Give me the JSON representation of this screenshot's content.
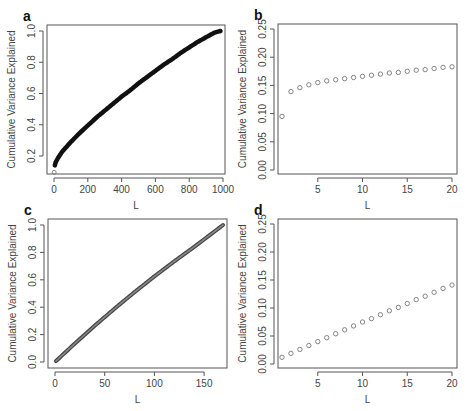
{
  "figure": {
    "panels": [
      "a",
      "b",
      "c",
      "d"
    ]
  },
  "chart_data": [
    {
      "panel": "a",
      "type": "scatter",
      "title": "",
      "xlabel": "L",
      "ylabel": "Cumulative Variance Explained",
      "xlim": [
        0,
        1000
      ],
      "ylim": [
        0.08,
        1.02
      ],
      "xticks": [
        0,
        200,
        400,
        600,
        800,
        1000
      ],
      "xtick_labels": [
        "0",
        "200",
        "400",
        "600",
        "800",
        "1000"
      ],
      "yticks": [
        0.2,
        0.4,
        0.6,
        0.8,
        1.0
      ],
      "ytick_labels": [
        "0.2",
        "0.4",
        "0.6",
        "0.8",
        "1.0"
      ],
      "grid": false,
      "legend": null,
      "description": "Dense points forming a thick concave curve from about 0.095 at L=1 to 1.0 at L≈985",
      "x": [
        1,
        5,
        10,
        25,
        50,
        100,
        150,
        200,
        250,
        300,
        350,
        400,
        450,
        500,
        550,
        600,
        650,
        700,
        750,
        800,
        850,
        900,
        950,
        985
      ],
      "y": [
        0.095,
        0.14,
        0.16,
        0.19,
        0.23,
        0.29,
        0.345,
        0.395,
        0.445,
        0.49,
        0.535,
        0.58,
        0.62,
        0.665,
        0.705,
        0.745,
        0.785,
        0.82,
        0.86,
        0.895,
        0.93,
        0.96,
        0.99,
        1.0
      ]
    },
    {
      "panel": "b",
      "type": "scatter",
      "title": "",
      "xlabel": "L",
      "ylabel": "Cumulative Variance Explained",
      "xlim": [
        0.5,
        20.5
      ],
      "ylim": [
        0.0,
        0.25
      ],
      "xticks": [
        5,
        10,
        15,
        20
      ],
      "xtick_labels": [
        "5",
        "10",
        "15",
        "20"
      ],
      "yticks": [
        0.0,
        0.05,
        0.1,
        0.15,
        0.2,
        0.25
      ],
      "ytick_labels": [
        "0.00",
        "0.05",
        "0.10",
        "0.15",
        "0.20",
        "0.25"
      ],
      "grid": false,
      "legend": null,
      "x": [
        1,
        2,
        3,
        4,
        5,
        6,
        7,
        8,
        9,
        10,
        11,
        12,
        13,
        14,
        15,
        16,
        17,
        18,
        19,
        20
      ],
      "y": [
        0.095,
        0.139,
        0.146,
        0.151,
        0.155,
        0.158,
        0.16,
        0.162,
        0.164,
        0.166,
        0.168,
        0.17,
        0.172,
        0.173,
        0.175,
        0.177,
        0.178,
        0.18,
        0.182,
        0.183
      ]
    },
    {
      "panel": "c",
      "type": "scatter",
      "title": "",
      "xlabel": "L",
      "ylabel": "Cumulative Variance Explained",
      "xlim": [
        0,
        170
      ],
      "ylim": [
        -0.02,
        1.02
      ],
      "xticks": [
        0,
        50,
        100,
        150
      ],
      "xtick_labels": [
        "0",
        "50",
        "100",
        "150"
      ],
      "yticks": [
        0.0,
        0.2,
        0.4,
        0.6,
        0.8,
        1.0
      ],
      "ytick_labels": [
        "0.0",
        "0.2",
        "0.4",
        "0.6",
        "0.8",
        "1.0"
      ],
      "grid": false,
      "legend": null,
      "description": "Dense points forming a nearly linear thick line from about 0.007 at L=1 to 1.0 at L≈169",
      "x": [
        1,
        20,
        40,
        60,
        80,
        100,
        120,
        140,
        160,
        169
      ],
      "y": [
        0.007,
        0.135,
        0.265,
        0.39,
        0.51,
        0.625,
        0.735,
        0.84,
        0.95,
        1.0
      ]
    },
    {
      "panel": "d",
      "type": "scatter",
      "title": "",
      "xlabel": "L",
      "ylabel": "Cumulative Variance Explained",
      "xlim": [
        0.5,
        20.5
      ],
      "ylim": [
        0.0,
        0.25
      ],
      "xticks": [
        5,
        10,
        15,
        20
      ],
      "xtick_labels": [
        "5",
        "10",
        "15",
        "20"
      ],
      "yticks": [
        0.0,
        0.05,
        0.1,
        0.15,
        0.2,
        0.25
      ],
      "ytick_labels": [
        "0.00",
        "0.05",
        "0.10",
        "0.15",
        "0.20",
        "0.25"
      ],
      "grid": false,
      "legend": null,
      "x": [
        1,
        2,
        3,
        4,
        5,
        6,
        7,
        8,
        9,
        10,
        11,
        12,
        13,
        14,
        15,
        16,
        17,
        18,
        19,
        20
      ],
      "y": [
        0.012,
        0.019,
        0.026,
        0.033,
        0.04,
        0.047,
        0.054,
        0.061,
        0.068,
        0.075,
        0.081,
        0.088,
        0.095,
        0.101,
        0.108,
        0.115,
        0.121,
        0.128,
        0.135,
        0.141
      ]
    }
  ]
}
